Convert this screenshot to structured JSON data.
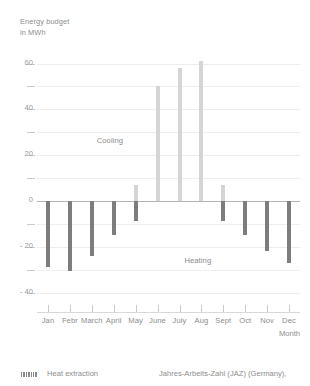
{
  "chart_data": {
    "type": "bar",
    "title": "",
    "ylabel": "Energy budget in MWh",
    "ylabel_line1": "Energy budget",
    "ylabel_line2": "in MWh",
    "xlabel": "Month",
    "ylim": [
      -45,
      65
    ],
    "ytick_labels": [
      "60",
      "40",
      "20",
      "0",
      "- 20",
      "- 40"
    ],
    "ytick_values": [
      60,
      40,
      20,
      0,
      -20,
      -40
    ],
    "yminor_values": [
      50,
      30,
      10,
      -10,
      -30
    ],
    "grid": true,
    "legend_position": "bottom-left",
    "categories": [
      "Jan",
      "Febr",
      "March",
      "April",
      "May",
      "June",
      "July",
      "Aug",
      "Sept",
      "Oct",
      "Nov",
      "Dec"
    ],
    "series": [
      {
        "name": "Heating",
        "color": "#7d7d7d",
        "values": [
          -29,
          -30.5,
          -24,
          -15,
          -9,
          0,
          0,
          0,
          -9,
          -15,
          -22,
          -27
        ]
      },
      {
        "name": "Cooling",
        "color": "#d5d5d5",
        "values": [
          0,
          0,
          0,
          0,
          7,
          50,
          58,
          61,
          7,
          0,
          0,
          0
        ]
      }
    ],
    "annotations": [
      {
        "text": "Cooling",
        "x_category": "April",
        "y_value": 26
      },
      {
        "text": "Heating",
        "x_category": "Aug",
        "y_value": -26
      }
    ]
  },
  "legend": {
    "swatch_name": "hatched-bar-swatch",
    "label": "Heat extraction"
  },
  "footer": {
    "source_note": "Jahres-Arbeits-Zahl (JAZ) (Germany),"
  },
  "colors": {
    "heating_bar": "#7d7d7d",
    "cooling_bar": "#d5d5d5",
    "gridline": "#efefef",
    "zeroline": "#b5b5b5",
    "text": "#8d8d8d",
    "background": "#ffffff"
  }
}
